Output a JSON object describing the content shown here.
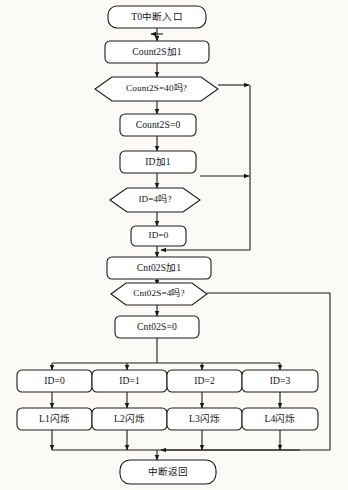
{
  "diagram": {
    "title_text": "T0中断入口",
    "type": "flowchart",
    "orientation": "top-to-bottom",
    "background_color": "#fbfaf7",
    "line_color": "#1a1a1a",
    "node_fill_color": "#ffffff",
    "text_color": "#141414",
    "nodes": [
      {
        "id": "start",
        "shape": "rounded-terminal",
        "label": "T0中断入口",
        "x": 108,
        "y": 6,
        "w": 98,
        "h": 22
      },
      {
        "id": "inc_count",
        "shape": "rounded-process",
        "label": "Count2S加1",
        "x": 105,
        "y": 41,
        "w": 104,
        "h": 22
      },
      {
        "id": "chk_count",
        "shape": "hexagon-decision",
        "label": "Count2S=40吗?",
        "x": 95,
        "y": 77,
        "w": 123,
        "h": 24
      },
      {
        "id": "clr_count",
        "shape": "rounded-process",
        "label": "Count2S=0",
        "x": 120,
        "y": 114,
        "w": 76,
        "h": 22
      },
      {
        "id": "inc_id",
        "shape": "rounded-process",
        "label": "ID加1",
        "x": 120,
        "y": 151,
        "w": 76,
        "h": 22
      },
      {
        "id": "chk_id",
        "shape": "hexagon-decision",
        "label": "ID=4吗?",
        "x": 110,
        "y": 188,
        "w": 90,
        "h": 24
      },
      {
        "id": "clr_id",
        "shape": "rounded-process",
        "label": "ID=0",
        "x": 131,
        "y": 226,
        "w": 55,
        "h": 20
      },
      {
        "id": "inc_cnt02",
        "shape": "rounded-process",
        "label": "Cnt02S加1",
        "x": 107,
        "y": 257,
        "w": 104,
        "h": 22
      },
      {
        "id": "chk_cnt02",
        "shape": "hexagon-decision",
        "label": "Cnt02S=4吗?",
        "x": 111,
        "y": 283,
        "w": 96,
        "h": 22
      },
      {
        "id": "clr_cnt02",
        "shape": "rounded-process",
        "label": "Cnt02S=0",
        "x": 115,
        "y": 316,
        "w": 84,
        "h": 22
      },
      {
        "id": "case_id0",
        "shape": "rounded-process",
        "label": "ID=0",
        "x": 17,
        "y": 370,
        "w": 75,
        "h": 22
      },
      {
        "id": "case_id1",
        "shape": "rounded-process",
        "label": "ID=1",
        "x": 92,
        "y": 370,
        "w": 75,
        "h": 22
      },
      {
        "id": "case_id2",
        "shape": "rounded-process",
        "label": "ID=2",
        "x": 167,
        "y": 370,
        "w": 75,
        "h": 22
      },
      {
        "id": "case_id3",
        "shape": "rounded-process",
        "label": "ID=3",
        "x": 242,
        "y": 370,
        "w": 76,
        "h": 22
      },
      {
        "id": "blink_l1",
        "shape": "rounded-process",
        "label": "L1闪烁",
        "x": 17,
        "y": 408,
        "w": 75,
        "h": 22
      },
      {
        "id": "blink_l2",
        "shape": "rounded-process",
        "label": "L2闪烁",
        "x": 92,
        "y": 408,
        "w": 75,
        "h": 22
      },
      {
        "id": "blink_l3",
        "shape": "rounded-process",
        "label": "L3闪烁",
        "x": 167,
        "y": 408,
        "w": 75,
        "h": 22
      },
      {
        "id": "blink_l4",
        "shape": "rounded-process",
        "label": "L4闪烁",
        "x": 242,
        "y": 408,
        "w": 76,
        "h": 22
      },
      {
        "id": "ret",
        "shape": "rounded-terminal",
        "label": "中断返回",
        "x": 120,
        "y": 460,
        "w": 96,
        "h": 24
      }
    ],
    "edge_notes": {
      "count_yes_branch": "Count2S=40吗? right exit joins vertical return bus at x=250",
      "id_yes_branch": "ID=4吗? right exit joins vertical return bus at x=250",
      "return_bus_merge": "return bus at x=250 turns left at y=250 and merges above Cnt02S加1",
      "cnt02_yes_branch": "Cnt02S=4吗? right exit runs to far-right bus at x=330 down to y=450 then left into 中断返回",
      "fanout_bus_y": 363,
      "collect_bus_y": 450,
      "branch_columns": [
        52,
        127,
        202,
        280
      ],
      "main_axis_x": 157
    }
  }
}
